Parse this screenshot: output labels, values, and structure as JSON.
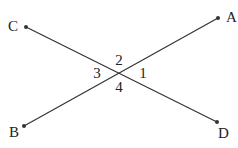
{
  "diagram": {
    "points": [
      {
        "id": "A",
        "label": "A",
        "x": 218,
        "y": 18,
        "lx": 226,
        "ly": 22
      },
      {
        "id": "B",
        "label": "B",
        "x": 24,
        "y": 126,
        "lx": 9,
        "ly": 137
      },
      {
        "id": "C",
        "label": "C",
        "x": 26,
        "y": 27,
        "lx": 8,
        "ly": 31
      },
      {
        "id": "D",
        "label": "D",
        "x": 217,
        "y": 122,
        "lx": 218,
        "ly": 138
      }
    ],
    "lines": [
      {
        "from": "B",
        "to": "A"
      },
      {
        "from": "C",
        "to": "D"
      }
    ],
    "angles": [
      {
        "label": "1",
        "x": 143,
        "y": 78
      },
      {
        "label": "2",
        "x": 119,
        "y": 65
      },
      {
        "label": "3",
        "x": 97,
        "y": 78
      },
      {
        "label": "4",
        "x": 119,
        "y": 92
      }
    ],
    "colors": {
      "line": "#333333",
      "text": "#222222"
    }
  }
}
